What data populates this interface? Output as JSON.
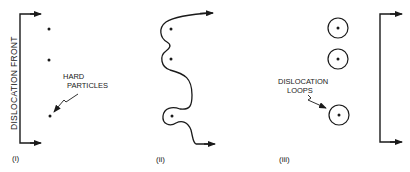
{
  "diagram": {
    "colors": {
      "ink": "#1a1a1a",
      "background": "#ffffff"
    },
    "panels": [
      {
        "id": "i",
        "label": "(i)",
        "axis_label": "DISLOCATION FRONT",
        "annotation": "HARD PARTICLES",
        "annotation_line1": "HARD",
        "annotation_line2": "PARTICLES",
        "description": "Straight dislocation front approaching three hard particles"
      },
      {
        "id": "ii",
        "label": "(ii)",
        "description": "Dislocation line bowing around the particles"
      },
      {
        "id": "iii",
        "label": "(iii)",
        "annotation": "DISLOCATION LOOPS",
        "annotation_line1": "DISLOCATION",
        "annotation_line2": "LOOPS",
        "description": "Dislocation passes, leaving loops around each particle"
      }
    ]
  }
}
